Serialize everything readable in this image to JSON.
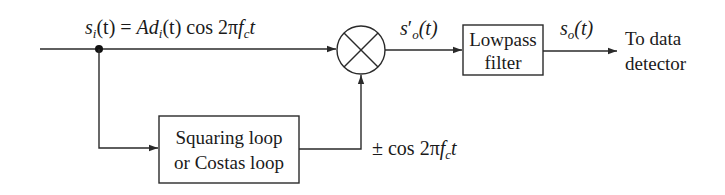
{
  "diagram": {
    "type": "block-diagram",
    "colors": {
      "line": "#2a2a2a",
      "text": "#1a1a1a",
      "background": "#ffffff"
    },
    "signals": {
      "input": {
        "lhs_s": "s",
        "lhs_sub": "i",
        "lhs_arg": "(t) = ",
        "A": "Ad",
        "A_sub": "i",
        "rest": "(t) cos 2π",
        "f": "f",
        "f_sub": "c",
        "t": "t"
      },
      "mixer_out": {
        "s": "s",
        "prime": "′",
        "sub": "o",
        "arg": "(t)"
      },
      "filter_out": {
        "s": "s",
        "sub": "o",
        "arg": "(t)"
      },
      "carrier": {
        "pm": "± cos 2π",
        "f": "f",
        "f_sub": "c",
        "t": "t"
      }
    },
    "blocks": {
      "mixer": {
        "symbol": "multiplier"
      },
      "lowpass": {
        "line1": "Lowpass",
        "line2": "filter"
      },
      "recovery": {
        "line1": "Squaring loop",
        "line2": "or Costas loop"
      }
    },
    "output": {
      "line1": "To data",
      "line2": "detector"
    }
  }
}
